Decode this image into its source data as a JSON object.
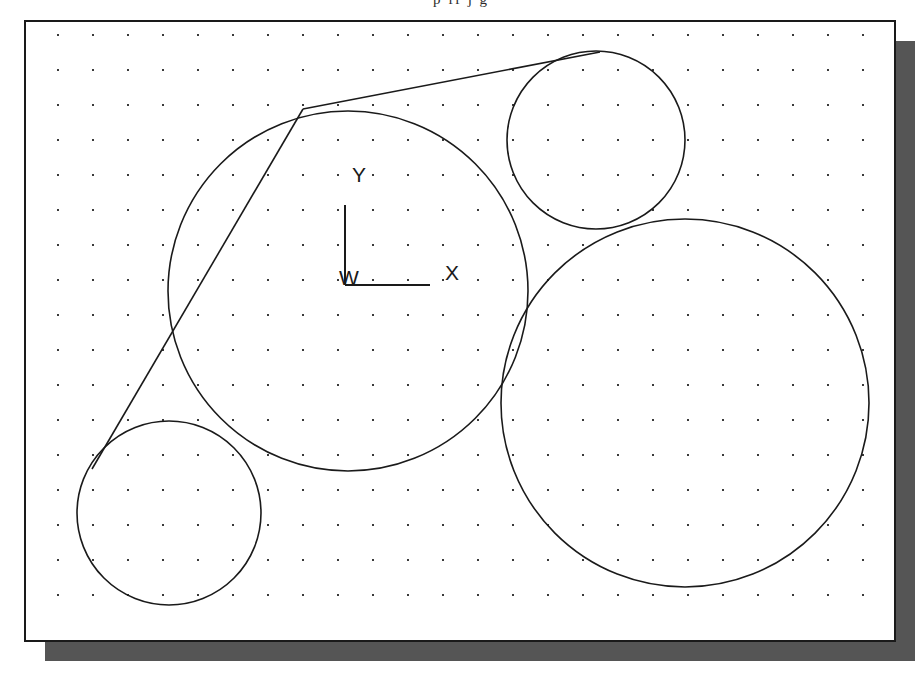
{
  "figure": {
    "type": "geometry-diagram",
    "title_fragment": "p   ff    j        g",
    "background_color": "#ffffff",
    "stroke_color": "#1a1a1a",
    "grid_dot_color": "#3a3a3a",
    "shadow_color": "#555555",
    "frame": {
      "x": 25,
      "y": 21,
      "width": 870,
      "height": 620,
      "border_width": 2,
      "shadow_offset_x": 20,
      "shadow_offset_y": 20
    },
    "grid": {
      "origin_x": 58,
      "origin_y": 35,
      "spacing": 35,
      "dot_size": 2,
      "cols": 24,
      "rows": 17
    }
  },
  "axes": {
    "name": "world-coordinate-system",
    "origin_x": 345,
    "origin_y": 285,
    "x_axis_length": 85,
    "y_axis_length": 80,
    "origin_label": "W",
    "x_label": "X",
    "y_label": "Y",
    "origin_label_pos": {
      "x": 349,
      "y": 285
    },
    "x_label_pos": {
      "x": 452,
      "y": 280
    },
    "y_label_pos": {
      "x": 359,
      "y": 182
    }
  },
  "chart_data": {
    "type": "scatter",
    "title": "",
    "xlabel": "X",
    "ylabel": "Y",
    "grid": true,
    "legend": "none",
    "circles": [
      {
        "id": "circle-large-center",
        "label": "large center circle",
        "cx": 348,
        "cy": 291,
        "r": 180
      },
      {
        "id": "circle-top-right",
        "label": "top right circle",
        "cx": 596,
        "cy": 140,
        "r": 89
      },
      {
        "id": "circle-bottom-right",
        "label": "bottom right circle",
        "cx": 685,
        "cy": 403,
        "r": 184
      },
      {
        "id": "circle-bottom-left",
        "label": "bottom left circle",
        "cx": 169,
        "cy": 513,
        "r": 92
      }
    ],
    "tangent_lines": [
      {
        "id": "tangent-upper-right",
        "label": "tangent to top-right circle",
        "x1": 303,
        "y1": 109,
        "x2": 600,
        "y2": 52
      },
      {
        "id": "tangent-left",
        "label": "tangent to bottom-left circle",
        "x1": 303,
        "y1": 109,
        "x2": 92,
        "y2": 469
      }
    ]
  }
}
